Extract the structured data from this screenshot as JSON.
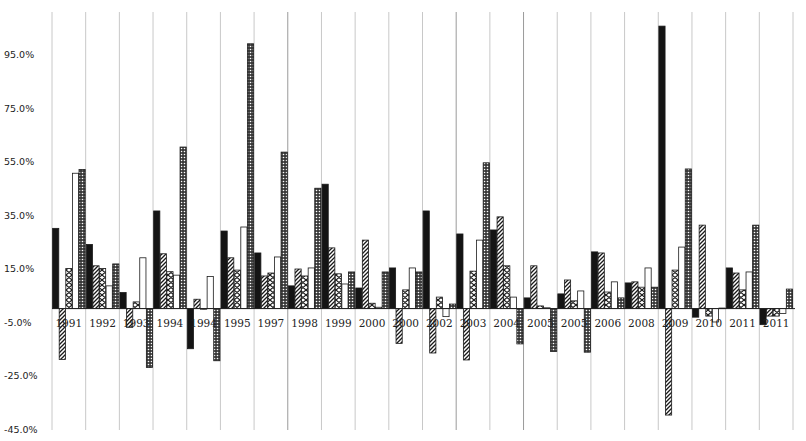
{
  "chart_data": {
    "type": "bar",
    "title": "",
    "xlabel": "",
    "ylabel": "",
    "ylim": [
      -45.0,
      105.0
    ],
    "yticks": [
      "95.0%",
      "75.0%",
      "55.0%",
      "35.0%",
      "15.0%",
      "-5.0%",
      "-25.0%",
      "-45.0%"
    ],
    "ytick_values": [
      95,
      75,
      55,
      35,
      15,
      -5,
      -25,
      -45
    ],
    "grid": {
      "vertical": true,
      "horizontal": false
    },
    "legend": null,
    "categories": [
      "1991",
      "1992",
      "1993",
      "1994",
      "1994",
      "1995",
      "1997",
      "1998",
      "1999",
      "2000",
      "2000",
      "2002",
      "2003",
      "2004",
      "2005",
      "2005",
      "2006",
      "2008",
      "2009",
      "2010",
      "2011",
      "2011"
    ],
    "series": [
      {
        "name": "Series 1",
        "pattern": "solid-black",
        "values": [
          30.0,
          24.0,
          6.0,
          36.5,
          -15.0,
          29.0,
          20.8,
          8.5,
          46.5,
          7.7,
          15.2,
          36.5,
          27.9,
          29.4,
          4.0,
          5.5,
          21.2,
          9.6,
          105.6,
          -3.2,
          15.2,
          -6.0
        ]
      },
      {
        "name": "Series 2",
        "pattern": "diagonal-hatch",
        "values": [
          -19.0,
          16.0,
          -7.0,
          20.5,
          3.5,
          19.0,
          12.2,
          14.8,
          22.7,
          25.6,
          -13.0,
          -16.6,
          -19.2,
          34.3,
          16.0,
          10.7,
          20.8,
          10.0,
          -39.8,
          31.2,
          13.3,
          -2.8
        ]
      },
      {
        "name": "Series 3",
        "pattern": "chevron",
        "values": [
          15.0,
          15.0,
          2.5,
          13.8,
          0.0,
          14.4,
          13.3,
          12.2,
          13.0,
          2.0,
          7.0,
          4.3,
          14.0,
          16.0,
          1.0,
          2.9,
          6.2,
          8.0,
          14.4,
          -2.8,
          7.0,
          -2.8
        ]
      },
      {
        "name": "Series 4",
        "pattern": "white",
        "values": [
          50.6,
          8.5,
          19.0,
          12.5,
          12.0,
          30.5,
          19.3,
          15.2,
          9.2,
          0.5,
          15.2,
          -3.0,
          25.6,
          4.3,
          0.3,
          6.6,
          10.0,
          15.2,
          23.0,
          -5.0,
          13.7,
          -1.8
        ]
      },
      {
        "name": "Series 5",
        "pattern": "checker",
        "values": [
          52.0,
          16.7,
          -22.0,
          60.4,
          -19.5,
          99.0,
          58.5,
          45.0,
          13.7,
          13.7,
          13.7,
          1.7,
          54.5,
          -13.2,
          -16.0,
          -16.3,
          4.0,
          8.0,
          52.2,
          0.2,
          31.2,
          7.3
        ]
      }
    ]
  },
  "colors": {
    "background": "#ffffff",
    "gridline": "#c8c8c8",
    "gridline_dark": "#9a9a9a",
    "axis": "#222222",
    "bar_dark": "#141414",
    "bar_stroke": "#1a1a1a"
  }
}
